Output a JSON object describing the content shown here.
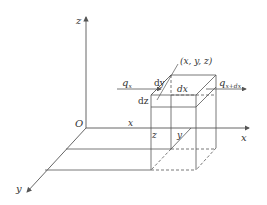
{
  "labels": {
    "z_axis": "z",
    "x_axis": "x",
    "y_axis": "y",
    "origin": "O",
    "point": "(x, y, z)",
    "q_in": "q",
    "q_in_sub": "x",
    "q_out": "q",
    "q_out_sub": "x+dx",
    "dx": "dx",
    "dy": "dy",
    "dz": "dz",
    "coord_x": "x",
    "coord_y": "y",
    "coord_z": "z"
  },
  "colors": {
    "line": "#555555",
    "text": "#333333"
  }
}
